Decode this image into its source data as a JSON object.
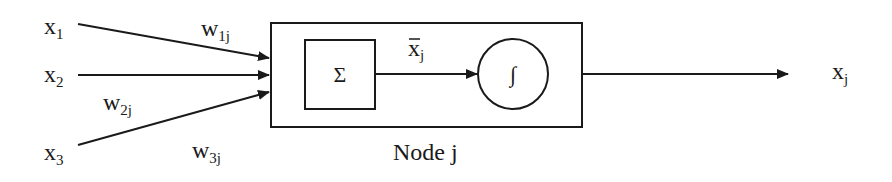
{
  "diagram": {
    "type": "neural-node",
    "inputs": [
      {
        "var": "x",
        "sub": "1",
        "weight_var": "w",
        "weight_sub": "1j"
      },
      {
        "var": "x",
        "sub": "2",
        "weight_var": "w",
        "weight_sub": "2j"
      },
      {
        "var": "x",
        "sub": "3",
        "weight_var": "w",
        "weight_sub": "3j"
      }
    ],
    "node": {
      "label": "Node j",
      "summation_symbol": "Σ",
      "activation_symbol": "∫",
      "intermediate_var": "x",
      "intermediate_sub": "j",
      "intermediate_overline": true
    },
    "output": {
      "var": "x",
      "sub": "j"
    }
  }
}
